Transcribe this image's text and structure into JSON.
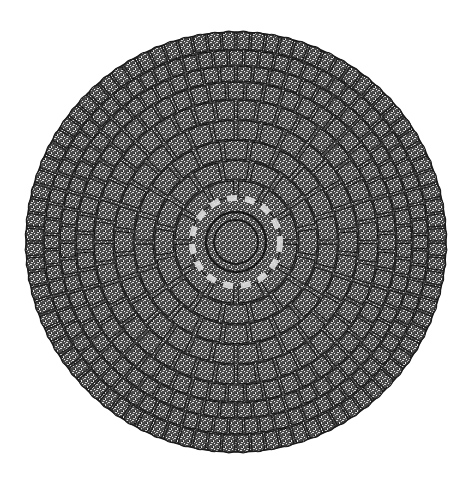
{
  "image": {
    "subject": "circular radiating cellular ink drawing",
    "width": 469,
    "height": 487,
    "background": "#ffffff",
    "ink": "#1a1a1a",
    "fill_dark": "#3a3a3a",
    "fill_light": "#8a8a8a",
    "center": {
      "x": 236,
      "y": 242
    },
    "outer_radius": 210,
    "core": {
      "radius": 22,
      "ring_radius": 30,
      "halo_radius": 44
    },
    "rings": [
      {
        "r_inner": 44,
        "r_outer": 62,
        "cells": 12
      },
      {
        "r_inner": 62,
        "r_outer": 82,
        "cells": 16
      },
      {
        "r_inner": 82,
        "r_outer": 102,
        "cells": 22
      },
      {
        "r_inner": 102,
        "r_outer": 122,
        "cells": 30
      },
      {
        "r_inner": 122,
        "r_outer": 142,
        "cells": 40
      },
      {
        "r_inner": 142,
        "r_outer": 160,
        "cells": 52
      },
      {
        "r_inner": 160,
        "r_outer": 176,
        "cells": 64
      },
      {
        "r_inner": 176,
        "r_outer": 192,
        "cells": 76
      },
      {
        "r_inner": 192,
        "r_outer": 210,
        "cells": 88
      }
    ]
  }
}
